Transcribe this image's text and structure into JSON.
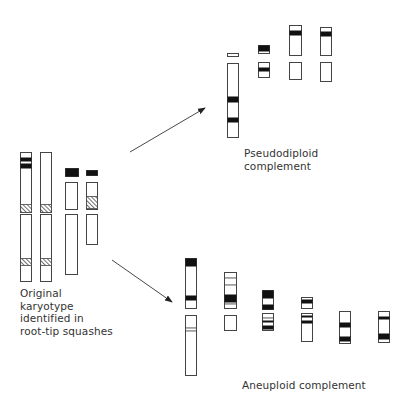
{
  "labels": {
    "original": "Original\nkaryotype\nidentified in\nroot-tip squashes",
    "pseudodiploid": "Pseudodiploid\ncomplement",
    "aneuploid": "Aneuploid complement"
  },
  "colors": {
    "stroke": "#444444",
    "band": "#111111",
    "background": "#ffffff"
  },
  "arrows": [
    {
      "name": "arrow-to-pseudodiploid",
      "x1": 130,
      "y1": 152,
      "x2": 205,
      "y2": 108
    },
    {
      "name": "arrow-to-aneuploid",
      "x1": 112,
      "y1": 260,
      "x2": 172,
      "y2": 302
    }
  ],
  "groups": [
    {
      "name": "original-karyotype",
      "segments": [
        {
          "x": 20,
          "y": 152,
          "w": 11,
          "h": 60,
          "bands": [
            {
              "y": 5,
              "h": 4,
              "type": "solid"
            },
            {
              "y": 11,
              "h": 5,
              "type": "solid"
            },
            {
              "y": 52,
              "h": 8,
              "type": "hatch"
            }
          ]
        },
        {
          "x": 20,
          "y": 214,
          "w": 11,
          "h": 67,
          "bands": [
            {
              "y": 44,
              "h": 7,
              "type": "hatch"
            }
          ]
        },
        {
          "x": 40,
          "y": 152,
          "w": 11,
          "h": 60,
          "bands": [
            {
              "y": 52,
              "h": 8,
              "type": "hatch"
            }
          ]
        },
        {
          "x": 40,
          "y": 214,
          "w": 11,
          "h": 67,
          "bands": [
            {
              "y": 44,
              "h": 7,
              "type": "hatch"
            }
          ]
        },
        {
          "x": 65,
          "y": 168,
          "w": 13,
          "h": 8,
          "bands": [
            {
              "y": 0,
              "h": 8,
              "type": "solid"
            }
          ]
        },
        {
          "x": 65,
          "y": 182,
          "w": 12,
          "h": 27,
          "bands": []
        },
        {
          "x": 65,
          "y": 214,
          "w": 12,
          "h": 60,
          "bands": []
        },
        {
          "x": 86,
          "y": 170,
          "w": 11,
          "h": 5,
          "bands": [
            {
              "y": 0,
              "h": 5,
              "type": "solid"
            }
          ]
        },
        {
          "x": 86,
          "y": 182,
          "w": 11,
          "h": 27,
          "bands": [
            {
              "y": 14,
              "h": 12,
              "type": "hatch"
            }
          ]
        },
        {
          "x": 86,
          "y": 214,
          "w": 11,
          "h": 30,
          "bands": []
        }
      ]
    },
    {
      "name": "pseudodiploid-complement",
      "segments": [
        {
          "x": 227,
          "y": 53,
          "w": 11,
          "h": 3,
          "bands": []
        },
        {
          "x": 227,
          "y": 63,
          "w": 11,
          "h": 74,
          "bands": [
            {
              "y": 33,
              "h": 6,
              "type": "solid"
            },
            {
              "y": 54,
              "h": 5,
              "type": "solid"
            }
          ]
        },
        {
          "x": 258,
          "y": 45,
          "w": 11,
          "h": 8,
          "bands": [
            {
              "y": 0,
              "h": 6,
              "type": "solid"
            }
          ]
        },
        {
          "x": 258,
          "y": 62,
          "w": 11,
          "h": 15,
          "bands": [
            {
              "y": 5,
              "h": 4,
              "type": "solid"
            }
          ]
        },
        {
          "x": 289,
          "y": 25,
          "w": 12,
          "h": 30,
          "bands": [
            {
              "y": 5,
              "h": 5,
              "type": "solid"
            }
          ]
        },
        {
          "x": 289,
          "y": 62,
          "w": 12,
          "h": 17,
          "bands": []
        },
        {
          "x": 320,
          "y": 27,
          "w": 11,
          "h": 28,
          "bands": [
            {
              "y": 4,
              "h": 5,
              "type": "solid"
            }
          ]
        },
        {
          "x": 320,
          "y": 62,
          "w": 11,
          "h": 19,
          "bands": []
        }
      ]
    },
    {
      "name": "aneuploid-complement",
      "segments": [
        {
          "x": 185,
          "y": 258,
          "w": 11,
          "h": 50,
          "bands": [
            {
              "y": 0,
              "h": 8,
              "type": "solid"
            },
            {
              "y": 37,
              "h": 5,
              "type": "solid"
            }
          ]
        },
        {
          "x": 185,
          "y": 315,
          "w": 11,
          "h": 60,
          "bands": [
            {
              "y": 12,
              "h": 1,
              "type": "line"
            },
            {
              "y": 15,
              "h": 1,
              "type": "line"
            }
          ]
        },
        {
          "x": 224,
          "y": 272,
          "w": 12,
          "h": 36,
          "bands": [
            {
              "y": 5,
              "h": 1,
              "type": "line"
            },
            {
              "y": 12,
              "h": 1,
              "type": "line"
            },
            {
              "y": 22,
              "h": 8,
              "type": "solid"
            },
            {
              "y": 31,
              "h": 1,
              "type": "line"
            }
          ]
        },
        {
          "x": 224,
          "y": 315,
          "w": 12,
          "h": 15,
          "bands": []
        },
        {
          "x": 262,
          "y": 290,
          "w": 11,
          "h": 19,
          "bands": [
            {
              "y": 0,
              "h": 8,
              "type": "solid"
            },
            {
              "y": 14,
              "h": 5,
              "type": "solid"
            }
          ]
        },
        {
          "x": 262,
          "y": 313,
          "w": 11,
          "h": 17,
          "bands": [
            {
              "y": 4,
              "h": 1,
              "type": "line"
            },
            {
              "y": 7,
              "h": 2,
              "type": "solid"
            },
            {
              "y": 12,
              "h": 4,
              "type": "solid"
            }
          ]
        },
        {
          "x": 301,
          "y": 297,
          "w": 11,
          "h": 11,
          "bands": [
            {
              "y": 2,
              "h": 4,
              "type": "solid"
            }
          ]
        },
        {
          "x": 301,
          "y": 313,
          "w": 11,
          "h": 28,
          "bands": [
            {
              "y": 2,
              "h": 2,
              "type": "solid"
            },
            {
              "y": 7,
              "h": 3,
              "type": "solid"
            }
          ]
        },
        {
          "x": 339,
          "y": 311,
          "w": 11,
          "h": 32,
          "bands": [
            {
              "y": 11,
              "h": 5,
              "type": "solid"
            },
            {
              "y": 25,
              "h": 5,
              "type": "solid"
            }
          ]
        },
        {
          "x": 378,
          "y": 311,
          "w": 11,
          "h": 31,
          "bands": [
            {
              "y": 5,
              "h": 3,
              "type": "solid"
            },
            {
              "y": 22,
              "h": 6,
              "type": "solid"
            }
          ]
        }
      ]
    }
  ]
}
